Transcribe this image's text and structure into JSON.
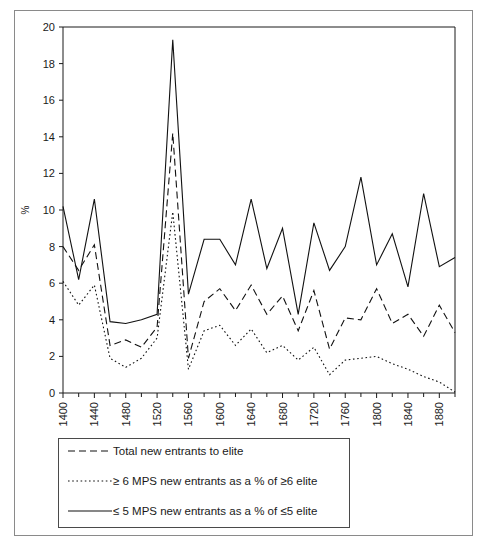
{
  "chart_data": {
    "type": "line",
    "title": "",
    "xlabel": "",
    "ylabel": "%",
    "xlim": [
      1400,
      1900
    ],
    "ylim": [
      0,
      20
    ],
    "ytick_step": 2,
    "yticks": [
      0,
      2,
      4,
      6,
      8,
      10,
      12,
      14,
      16,
      18,
      20
    ],
    "xticks": [
      1400,
      1440,
      1480,
      1520,
      1560,
      1600,
      1640,
      1680,
      1720,
      1760,
      1800,
      1840,
      1880
    ],
    "xtick_labels": [
      "1400",
      "1440",
      "1480",
      "1520",
      "1560",
      "1600",
      "1640",
      "1680",
      "1720",
      "1760",
      "1800",
      "1840",
      "1880"
    ],
    "minor_tick_interval": 20,
    "grid": false,
    "legend_position": "below-plot",
    "x": [
      1400,
      1420,
      1440,
      1460,
      1480,
      1500,
      1520,
      1540,
      1560,
      1580,
      1600,
      1620,
      1640,
      1660,
      1680,
      1700,
      1720,
      1740,
      1760,
      1780,
      1800,
      1820,
      1840,
      1860,
      1880,
      1900
    ],
    "series": [
      {
        "name": "Total new entrants to elite",
        "style": "dashed",
        "values": [
          8.0,
          6.7,
          8.1,
          2.6,
          2.9,
          2.5,
          3.6,
          14.2,
          1.9,
          5.0,
          5.7,
          4.5,
          5.9,
          4.3,
          5.3,
          3.4,
          5.6,
          2.4,
          4.1,
          4.0,
          5.7,
          3.8,
          4.3,
          3.1,
          4.8,
          3.3
        ]
      },
      {
        "name": "≥ 6 MPS new entrants as a % of ≥6 elite",
        "style": "dotted",
        "values": [
          6.1,
          4.8,
          5.9,
          1.9,
          1.4,
          1.9,
          3.0,
          9.9,
          1.3,
          3.4,
          3.7,
          2.6,
          3.5,
          2.2,
          2.6,
          1.8,
          2.5,
          1.0,
          1.8,
          1.9,
          2.0,
          1.6,
          1.3,
          0.9,
          0.6,
          0.05
        ]
      },
      {
        "name": "≤ 5 MPS new entrants as a % of ≤5 elite",
        "style": "solid",
        "values": [
          10.2,
          6.2,
          10.6,
          3.9,
          3.8,
          4.0,
          4.3,
          19.3,
          5.4,
          8.4,
          8.4,
          7.0,
          10.6,
          6.8,
          9.0,
          4.3,
          9.3,
          6.7,
          8.0,
          11.8,
          7.0,
          8.7,
          5.8,
          10.9,
          6.9,
          7.4
        ]
      }
    ]
  },
  "axis": {
    "y_title": "%"
  },
  "legend": {
    "entries": [
      {
        "icon": "dashed-line-swatch",
        "label": "Total new entrants to elite"
      },
      {
        "icon": "dotted-line-swatch",
        "label": "≥ 6 MPS new entrants as a % of ≥6 elite"
      },
      {
        "icon": "solid-line-swatch",
        "label": "≤ 5 MPS new entrants as a % of ≤5 elite"
      }
    ]
  }
}
